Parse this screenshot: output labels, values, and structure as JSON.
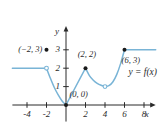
{
  "figure": {
    "kind": "piecewise-function-graph",
    "colors": {
      "curve": "#79b4d6",
      "axis": "#2b2b2b",
      "point_fill": "#1a1a1a",
      "point_open_fill": "#ffffff",
      "text": "#2b2b2b",
      "background": "#ffffff"
    },
    "function_label": "y = f(x)",
    "axes": {
      "x_label": "x",
      "y_label": "y",
      "x_ticks": [
        "-4",
        "-2",
        "2",
        "4",
        "6",
        "8"
      ],
      "x_tick_values": [
        -4,
        -2,
        2,
        4,
        6,
        8
      ],
      "y_ticks": [
        "1",
        "2",
        "3"
      ],
      "y_tick_values": [
        1,
        2,
        3
      ],
      "x_range": [
        -5.5,
        9.2
      ],
      "y_range": [
        -0.9,
        4.3
      ]
    },
    "annotations": [
      {
        "text": "(−2, 3)",
        "x": -4.9,
        "y": 3.0
      },
      {
        "text": "(2, 2)",
        "x": 1.2,
        "y": 2.75
      },
      {
        "text": "(0, 0)",
        "x": 0.35,
        "y": 0.55
      },
      {
        "text": "(6, 3)",
        "x": 5.7,
        "y": 2.42
      },
      {
        "text": "y = f(x)",
        "x": 6.4,
        "y": 1.72
      }
    ]
  },
  "chart_data": {
    "type": "line",
    "title": "",
    "xlabel": "x",
    "ylabel": "y",
    "xlim": [
      -5.5,
      9.2
    ],
    "ylim": [
      -0.9,
      4.3
    ],
    "grid": false,
    "legend": null,
    "annotations": [
      "(−2, 3)",
      "(2, 2)",
      "(0, 0)",
      "(6, 3)",
      "y = f(x)"
    ],
    "series": [
      {
        "name": "left-constant-ray",
        "comment": "horizontal ray y=2 for x <= -2, open at x=-2",
        "points": [
          [
            -5.5,
            2
          ],
          [
            -2,
            2
          ]
        ]
      },
      {
        "name": "descending-parabola-arc",
        "comment": "from (-2,2) down to (0,0)",
        "points": [
          [
            -2,
            2
          ],
          [
            -1.6,
            1.45
          ],
          [
            -1.2,
            0.95
          ],
          [
            -0.8,
            0.55
          ],
          [
            -0.4,
            0.22
          ],
          [
            0,
            0
          ]
        ]
      },
      {
        "name": "rising-segment",
        "comment": "from (0,0) up to (2,2)",
        "points": [
          [
            0,
            0
          ],
          [
            2,
            2
          ]
        ]
      },
      {
        "name": "decaying-arc",
        "comment": "from (2,2) down to open circle at (4,1)",
        "points": [
          [
            2,
            2
          ],
          [
            2.4,
            1.6
          ],
          [
            2.8,
            1.35
          ],
          [
            3.2,
            1.18
          ],
          [
            3.6,
            1.07
          ],
          [
            4,
            1
          ]
        ]
      },
      {
        "name": "rising-parabola-arc",
        "comment": "from (4,1) up to (6,3)",
        "points": [
          [
            4,
            1
          ],
          [
            4.4,
            1.05
          ],
          [
            4.8,
            1.25
          ],
          [
            5.2,
            1.65
          ],
          [
            5.6,
            2.25
          ],
          [
            6,
            3
          ]
        ]
      },
      {
        "name": "right-constant-ray",
        "comment": "horizontal ray y=3 for x >= 6",
        "points": [
          [
            6,
            3
          ],
          [
            9.2,
            3
          ]
        ]
      }
    ],
    "markers": [
      {
        "kind": "open",
        "x": -2,
        "y": 2,
        "label": null
      },
      {
        "kind": "filled",
        "x": -2,
        "y": 3,
        "label": "(−2, 3)"
      },
      {
        "kind": "filled",
        "x": 0,
        "y": 0,
        "label": "(0, 0)"
      },
      {
        "kind": "filled",
        "x": 2,
        "y": 2,
        "label": "(2, 2)"
      },
      {
        "kind": "open",
        "x": 4,
        "y": 1,
        "label": null
      },
      {
        "kind": "filled",
        "x": 6,
        "y": 3,
        "label": "(6, 3)"
      }
    ]
  }
}
